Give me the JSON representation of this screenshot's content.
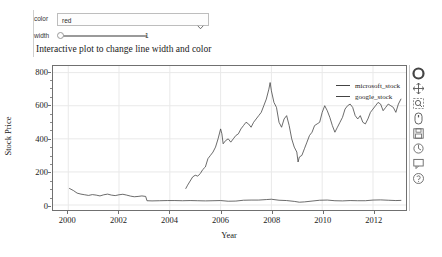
{
  "widgets": {
    "color": {
      "label": "color",
      "value": "red",
      "options": [
        "red",
        "blue",
        "green",
        "black",
        "orange"
      ],
      "icon": "chevron-down-icon"
    },
    "width": {
      "label": "width",
      "value": "1",
      "min": "1",
      "max": "5"
    }
  },
  "plot": {
    "title": "Interactive plot to change line width and color"
  },
  "toolbar": {
    "items": [
      {
        "name": "bokeh-logo-icon",
        "label": "Bokeh"
      },
      {
        "name": "pan-tool-icon",
        "label": "Pan"
      },
      {
        "name": "box-zoom-tool-icon",
        "label": "Box Zoom"
      },
      {
        "name": "wheel-zoom-tool-icon",
        "label": "Wheel Zoom"
      },
      {
        "name": "save-tool-icon",
        "label": "Save"
      },
      {
        "name": "reset-tool-icon",
        "label": "Reset"
      },
      {
        "name": "hover-tool-icon",
        "label": "Hover"
      },
      {
        "name": "help-icon",
        "label": "Help"
      }
    ]
  },
  "chart_data": {
    "type": "line",
    "title": "Interactive plot to change line width and color",
    "xlabel": "Year",
    "ylabel": "Stock Price",
    "xlim": [
      1999.4,
      2013.3
    ],
    "ylim": [
      -30,
      840
    ],
    "xticks": [
      2000,
      2002,
      2004,
      2006,
      2008,
      2010,
      2012
    ],
    "yticks": [
      0,
      200,
      400,
      600,
      800
    ],
    "grid": true,
    "legend_position": "top-right",
    "series": [
      {
        "name": "microsoft_stock",
        "color": "#444444",
        "x": [
          2000.05,
          2000.2,
          2000.35,
          2000.5,
          2000.65,
          2000.8,
          2000.95,
          2001.1,
          2001.25,
          2001.4,
          2001.55,
          2001.7,
          2001.85,
          2002.0,
          2002.15,
          2002.3,
          2002.45,
          2002.6,
          2002.75,
          2002.9,
          2003.05,
          2003.1,
          2003.3,
          2003.6,
          2003.9,
          2004.2,
          2004.5,
          2004.8,
          2005.1,
          2005.4,
          2005.7,
          2006.0,
          2006.3,
          2006.6,
          2006.9,
          2007.2,
          2007.5,
          2007.8,
          2008.0,
          2008.3,
          2008.6,
          2008.9,
          2009.1,
          2009.3,
          2009.6,
          2009.9,
          2010.2,
          2010.5,
          2010.8,
          2011.1,
          2011.4,
          2011.7,
          2012.0,
          2012.3,
          2012.6,
          2012.9,
          2013.1
        ],
        "y": [
          100,
          88,
          72,
          66,
          62,
          58,
          63,
          60,
          55,
          62,
          66,
          60,
          57,
          62,
          65,
          60,
          54,
          50,
          52,
          55,
          52,
          26,
          25,
          26,
          27,
          27,
          26,
          27,
          26,
          25,
          26,
          27,
          23,
          24,
          29,
          30,
          30,
          33,
          35,
          29,
          27,
          22,
          17,
          19,
          24,
          29,
          30,
          26,
          25,
          27,
          26,
          26,
          30,
          31,
          29,
          27,
          28
        ]
      },
      {
        "name": "google_stock",
        "color": "#444444",
        "x": [
          2004.63,
          2004.7,
          2004.8,
          2004.9,
          2005.0,
          2005.1,
          2005.2,
          2005.3,
          2005.4,
          2005.5,
          2005.6,
          2005.7,
          2005.8,
          2005.9,
          2006.0,
          2006.05,
          2006.1,
          2006.2,
          2006.3,
          2006.4,
          2006.5,
          2006.6,
          2006.7,
          2006.8,
          2006.9,
          2007.0,
          2007.1,
          2007.2,
          2007.3,
          2007.4,
          2007.5,
          2007.6,
          2007.7,
          2007.8,
          2007.9,
          2007.95,
          2008.0,
          2008.1,
          2008.2,
          2008.3,
          2008.4,
          2008.5,
          2008.6,
          2008.7,
          2008.8,
          2008.9,
          2009.0,
          2009.05,
          2009.1,
          2009.2,
          2009.3,
          2009.4,
          2009.5,
          2009.6,
          2009.7,
          2009.8,
          2009.9,
          2010.0,
          2010.1,
          2010.2,
          2010.3,
          2010.4,
          2010.5,
          2010.6,
          2010.7,
          2010.8,
          2010.9,
          2011.0,
          2011.1,
          2011.2,
          2011.3,
          2011.4,
          2011.5,
          2011.6,
          2011.7,
          2011.8,
          2011.9,
          2012.0,
          2012.1,
          2012.2,
          2012.3,
          2012.4,
          2012.5,
          2012.6,
          2012.7,
          2012.8,
          2012.9,
          2013.0,
          2013.1
        ],
        "y": [
          100,
          120,
          145,
          170,
          180,
          175,
          190,
          215,
          230,
          280,
          300,
          320,
          350,
          400,
          460,
          430,
          370,
          390,
          400,
          380,
          400,
          420,
          430,
          460,
          480,
          500,
          490,
          470,
          500,
          520,
          540,
          560,
          600,
          640,
          700,
          740,
          690,
          620,
          590,
          500,
          470,
          520,
          540,
          480,
          400,
          350,
          320,
          260,
          290,
          300,
          340,
          380,
          420,
          440,
          480,
          490,
          500,
          560,
          600,
          570,
          530,
          480,
          440,
          470,
          500,
          530,
          580,
          600,
          610,
          590,
          540,
          520,
          540,
          500,
          490,
          520,
          560,
          580,
          600,
          620,
          610,
          570,
          590,
          610,
          600,
          590,
          560,
          610,
          640
        ]
      }
    ]
  }
}
